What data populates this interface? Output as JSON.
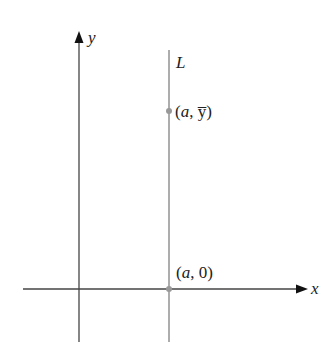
{
  "diagram": {
    "axes": {
      "x_label": "x",
      "y_label": "y",
      "color": "#444444"
    },
    "line": {
      "label": "L",
      "color": "#999999"
    },
    "points": [
      {
        "label_open": "(",
        "label_var": "a",
        "label_sep": ", ",
        "label_val": "y̅",
        "label_close": ")",
        "desc": "(a, ȳ)",
        "color": "#999999"
      },
      {
        "label_open": "(",
        "label_var": "a",
        "label_sep": ", ",
        "label_val": "0",
        "label_close": ")",
        "desc": "(a, 0)",
        "color": "#999999"
      }
    ]
  }
}
